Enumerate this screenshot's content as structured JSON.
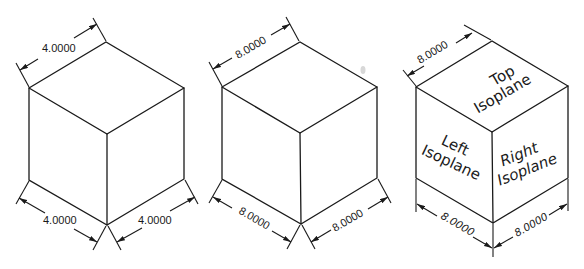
{
  "figure": {
    "cubes": [
      {
        "id": "cube-1",
        "dimensions": {
          "top": "4.0000",
          "bottom_left": "4.0000",
          "bottom_right": "4.0000"
        }
      },
      {
        "id": "cube-2",
        "dimensions": {
          "top": "8.0000",
          "bottom_left": "8.0000",
          "bottom_right": "8.0000"
        }
      },
      {
        "id": "cube-3",
        "dimensions": {
          "top": "8.0000",
          "bottom_left": "8.0000",
          "bottom_right": "8.0000"
        },
        "faces": {
          "top": {
            "line1": "Top",
            "line2": "Isoplane"
          },
          "left": {
            "line1": "Left",
            "line2": "Isoplane"
          },
          "right": {
            "line1": "Right",
            "line2": "Isoplane"
          }
        }
      }
    ]
  }
}
